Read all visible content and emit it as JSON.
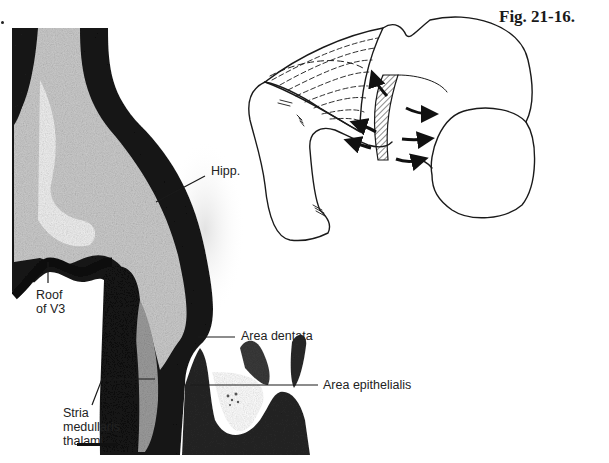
{
  "figure": {
    "title": "Fig. 21-16."
  },
  "micrograph": {
    "labels": {
      "hipp": "Hipp.",
      "roof_v3_line1": "Roof",
      "roof_v3_line2": "of V3",
      "area_dentata": "Area dentata",
      "area_epithelialis": "Area epithelialis",
      "stria_line1": "Stria",
      "stria_line2": "medullaris",
      "stria_line3": "thalami"
    },
    "scale_bar": "scale-bar"
  },
  "diagram": {
    "arrows_count": 6
  },
  "colors": {
    "tissue_dark": "#141414",
    "tissue_mid": "#8a8a8a",
    "tissue_light": "#d8d8d8",
    "stria_gray": "#9a9a9a",
    "line": "#1a1a1a",
    "background": "#ffffff"
  }
}
